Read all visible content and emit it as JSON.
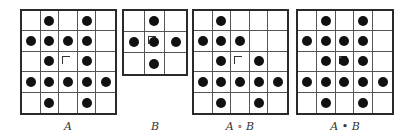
{
  "figure": {
    "panels": [
      {
        "id": "A",
        "label": "A",
        "rows": 5,
        "cols": 5,
        "origin": [
          2,
          2
        ],
        "pixels": [
          [
            0,
            1,
            0,
            1,
            0
          ],
          [
            1,
            1,
            1,
            1,
            0
          ],
          [
            0,
            1,
            0,
            1,
            0
          ],
          [
            1,
            1,
            1,
            1,
            1
          ],
          [
            0,
            1,
            0,
            1,
            0
          ]
        ],
        "box": {
          "x": 20,
          "y": 9,
          "w": 97,
          "h": 106
        }
      },
      {
        "id": "B",
        "label": "B",
        "rows": 3,
        "cols": 3,
        "origin": [
          1,
          1
        ],
        "pixels": [
          [
            0,
            1,
            0
          ],
          [
            1,
            1,
            1
          ],
          [
            0,
            1,
            0
          ]
        ],
        "box": {
          "x": 122,
          "y": 9,
          "w": 66,
          "h": 67
        }
      },
      {
        "id": "A-open-B",
        "label": "A ∘ B",
        "rows": 5,
        "cols": 5,
        "origin": [
          2,
          2
        ],
        "pixels": [
          [
            0,
            1,
            0,
            0,
            0
          ],
          [
            1,
            1,
            1,
            0,
            0
          ],
          [
            0,
            1,
            0,
            1,
            0
          ],
          [
            1,
            1,
            1,
            1,
            1
          ],
          [
            0,
            1,
            0,
            1,
            0
          ]
        ],
        "box": {
          "x": 192,
          "y": 9,
          "w": 97,
          "h": 106
        }
      },
      {
        "id": "A-close-B",
        "label": "A • B",
        "rows": 5,
        "cols": 5,
        "origin": [
          2,
          2
        ],
        "pixels": [
          [
            0,
            1,
            0,
            1,
            0
          ],
          [
            1,
            1,
            1,
            1,
            0
          ],
          [
            0,
            1,
            1,
            1,
            0
          ],
          [
            1,
            1,
            1,
            1,
            1
          ],
          [
            0,
            1,
            0,
            1,
            0
          ]
        ],
        "box": {
          "x": 296,
          "y": 9,
          "w": 98,
          "h": 106
        }
      }
    ],
    "labels": {
      "a": "A",
      "b": "B",
      "opening": "A ∘ B",
      "closing": "A • B"
    },
    "colors": {
      "pixel": "#111111",
      "grid_border": "#2a2a2a",
      "grid_line": "#555555",
      "background": "#ffffff"
    }
  }
}
